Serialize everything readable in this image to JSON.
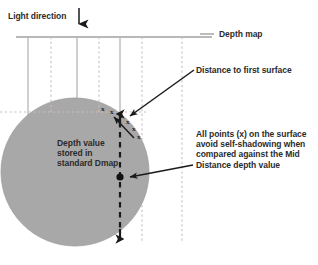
{
  "figure": {
    "type": "technical-diagram",
    "background_color": "#ffffff"
  },
  "colors": {
    "sphere_fill": "#a8a8a8",
    "sphere_edge": "#9a9a9a",
    "ray_solid": "#b5b5b5",
    "ray_dashed": "#c9b7b7",
    "depth_map_line": "#a0a0a0",
    "arrow_black": "#1a1a1a",
    "text": "#2b2b2b"
  },
  "labels": {
    "light_direction": "Light direction",
    "depth_map": "Depth map",
    "distance_to_first_surface": "Distance to first surface",
    "depth_value_stored": "Depth value\nstored in\nstandard Dmap",
    "all_points_note": "All points (x) on the surface\navoid self-shadowing when\ncompared against the Mid\nDistance depth value"
  },
  "markers": {
    "surface_point_glyph": "x",
    "surface_points": [
      {
        "x": 103,
        "y": 110
      },
      {
        "x": 112,
        "y": 113
      },
      {
        "x": 120,
        "y": 117
      },
      {
        "x": 126,
        "y": 122
      },
      {
        "x": 132,
        "y": 128
      },
      {
        "x": 136,
        "y": 135
      }
    ],
    "mid_distance_dot": {
      "x": 120,
      "y": 177,
      "r": 3.4
    }
  },
  "geometry": {
    "sphere": {
      "cx": 75,
      "cy": 172,
      "r": 74
    },
    "depth_map_line": {
      "x1": 16,
      "y1": 37,
      "x2": 212,
      "y2": 37
    },
    "light_arrow": {
      "x": 79,
      "y1": 8,
      "y2": 30
    },
    "solid_rays_x": [
      28,
      77,
      120
    ],
    "dashed_rays_x": [
      51,
      99,
      142,
      182
    ],
    "horizontal_dashed_y": 112,
    "mid_distance_arrow": {
      "x": 120,
      "y_top": 112,
      "y_bottom": 241
    },
    "leader_first_surface": {
      "x1": 194,
      "y1": 70,
      "x2": 127,
      "y2": 118
    },
    "leader_depth_value": {
      "x1": 133,
      "y1": 137,
      "x2": 113,
      "y2": 116
    },
    "leader_all_points": {
      "x1": 193,
      "y1": 163,
      "x2": 128,
      "y2": 177
    },
    "leader_depth_map": {
      "x1": 199,
      "y1": 34,
      "x2": 213,
      "y2": 34
    }
  }
}
